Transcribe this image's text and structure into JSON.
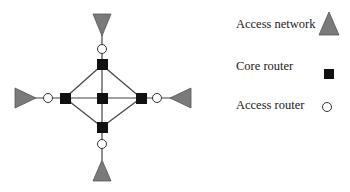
{
  "legend": {
    "items": [
      {
        "label": "Access network",
        "symbol": "gray-triangle"
      },
      {
        "label": "Core router",
        "symbol": "black-square"
      },
      {
        "label": "Access router",
        "symbol": "white-circle"
      }
    ]
  },
  "colors": {
    "access_network_fill": "#7a7a7a",
    "core_router_fill": "#111111",
    "access_router_fill": "#ffffff",
    "link": "#444444"
  },
  "topology": {
    "core_routers": [
      "top",
      "left",
      "center",
      "right",
      "bottom"
    ],
    "access_routers": [
      "top",
      "left",
      "right",
      "bottom"
    ],
    "access_networks": [
      "top",
      "left",
      "right",
      "bottom"
    ]
  }
}
